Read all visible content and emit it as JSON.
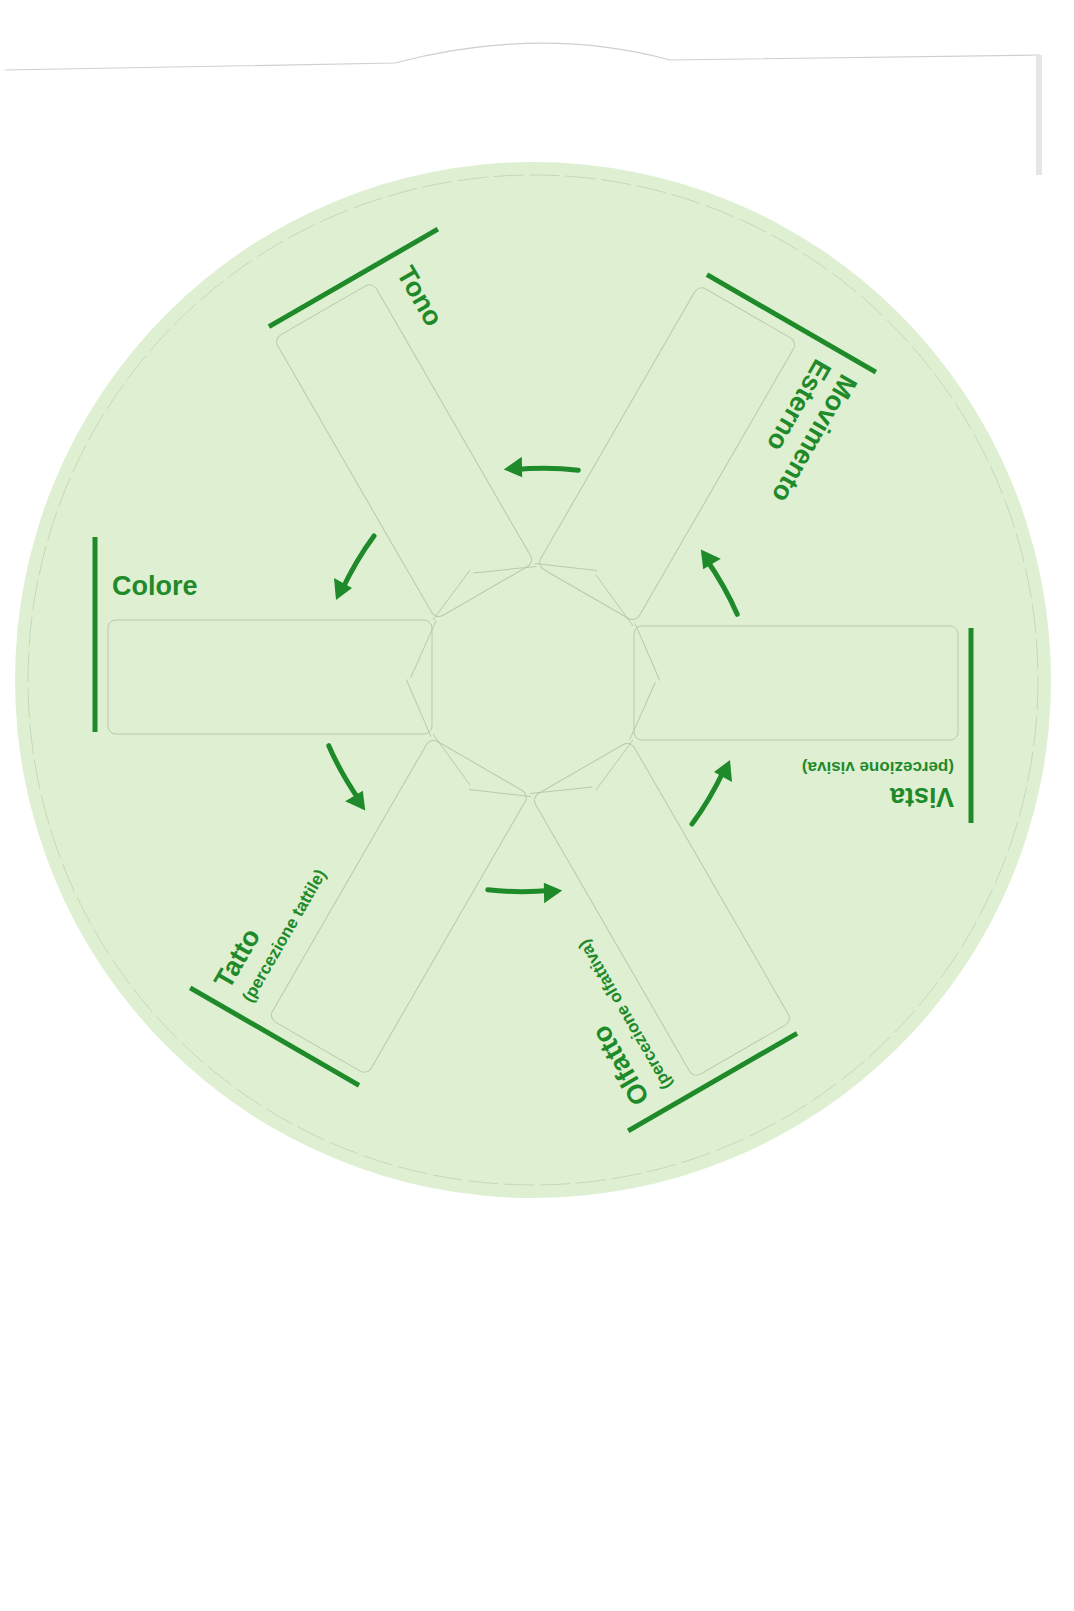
{
  "diagram": {
    "type": "sensory-wheel",
    "colors": {
      "disc_fill": "#dff0d2",
      "accent_green": "#1f8a2a",
      "cut_line": "#b9c9b0",
      "page_bg": "#ffffff"
    },
    "segments": [
      {
        "title": "Colore",
        "subtitle": ""
      },
      {
        "title": "Tono",
        "subtitle": ""
      },
      {
        "title": "Movimento",
        "title_line2": "Esterno",
        "subtitle": ""
      },
      {
        "title": "Vista",
        "subtitle": "(percezione visiva)"
      },
      {
        "title": "Olfatto",
        "subtitle": "(percezione olfattiva)"
      },
      {
        "title": "Tatto",
        "subtitle": "(percezione tattile)"
      }
    ],
    "arrows": {
      "count": 6,
      "direction": "counterclockwise",
      "icon": "curved-arrow-icon"
    }
  }
}
